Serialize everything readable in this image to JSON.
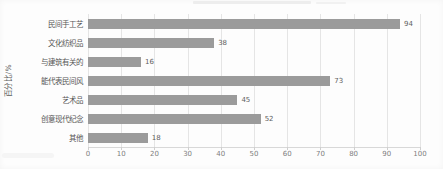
{
  "chart_data": {
    "type": "bar",
    "orientation": "horizontal",
    "categories": [
      "民间手工艺",
      "文化纺织品",
      "与建筑有关的",
      "能代表民间风",
      "艺术品",
      "创意现代纪念",
      "其他"
    ],
    "values": [
      94,
      38,
      16,
      73,
      45,
      52,
      18
    ],
    "value_labels": [
      "94",
      "38",
      "16",
      "73",
      "45",
      "52",
      "18"
    ],
    "title": "",
    "xlabel": "",
    "ylabel": "百分比/%",
    "xlim": [
      0,
      100
    ],
    "xticks": [
      0,
      10,
      20,
      30,
      40,
      50,
      60,
      70,
      80,
      90,
      100
    ],
    "grid": "vertical",
    "legend": "none",
    "bar_color": "#9b9b9b",
    "gridline_color": "#e5e5e5",
    "axis_line_color": "#d8d8d8"
  }
}
